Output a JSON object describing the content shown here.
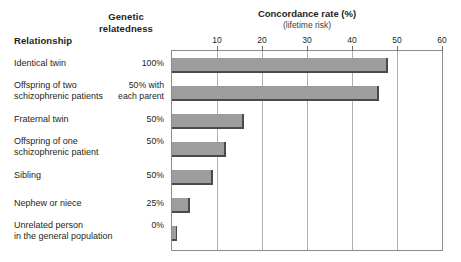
{
  "headers": {
    "relationship": "Relationship",
    "genetic_relatedness_line1": "Genetic",
    "genetic_relatedness_line2": "relatedness"
  },
  "chart_data": {
    "type": "bar",
    "orientation": "horizontal",
    "title": "Concordance rate (%)",
    "subtitle": "(lifetime risk)",
    "xlabel": "Concordance rate (%)",
    "ylabel": "Relationship",
    "xlim": [
      0,
      60
    ],
    "xticks": [
      10,
      20,
      30,
      40,
      50,
      60
    ],
    "grid": true,
    "legend": "none",
    "bar_color": "#9d9d9d",
    "bar_shadow_color": "#4a4a4a",
    "categories": [
      "Identical twin",
      "Offspring of two schizophrenic patients",
      "Fraternal twin",
      "Offspring of one schizophrenic patient",
      "Sibling",
      "Nephew or niece",
      "Unrelated person in the general population"
    ],
    "values": [
      48,
      46,
      16,
      12,
      9,
      4,
      1
    ],
    "genetic_relatedness": [
      "100%",
      "50% with each parent",
      "50%",
      "50%",
      "50%",
      "25%",
      "0%"
    ],
    "rows": [
      {
        "relationship_lines": [
          "Identical twin"
        ],
        "relatedness_lines": [
          "100%"
        ],
        "value": 48
      },
      {
        "relationship_lines": [
          "Offspring of two",
          "schizophrenic patients"
        ],
        "relatedness_lines": [
          "50% with",
          "each parent"
        ],
        "value": 46
      },
      {
        "relationship_lines": [
          "Fraternal twin"
        ],
        "relatedness_lines": [
          "50%"
        ],
        "value": 16
      },
      {
        "relationship_lines": [
          "Offspring of one",
          "schizophrenic patient"
        ],
        "relatedness_lines": [
          "50%"
        ],
        "value": 12
      },
      {
        "relationship_lines": [
          "Sibling"
        ],
        "relatedness_lines": [
          "50%"
        ],
        "value": 9
      },
      {
        "relationship_lines": [
          "Nephew or niece"
        ],
        "relatedness_lines": [
          "25%"
        ],
        "value": 4
      },
      {
        "relationship_lines": [
          "Unrelated person",
          "in the general population"
        ],
        "relatedness_lines": [
          "0%"
        ],
        "value": 1
      }
    ]
  }
}
